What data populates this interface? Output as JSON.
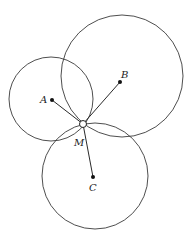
{
  "diagram": {
    "type": "geometry",
    "points": {
      "A": {
        "label": "A",
        "x": 52,
        "y": 100,
        "label_x": 40,
        "label_y": 103
      },
      "B": {
        "label": "B",
        "x": 120,
        "y": 82,
        "label_x": 121,
        "label_y": 78
      },
      "C": {
        "label": "C",
        "x": 93,
        "y": 177,
        "label_x": 89,
        "label_y": 191
      },
      "M": {
        "label": "M",
        "x": 83,
        "y": 124,
        "label_x": 74,
        "label_y": 146
      }
    },
    "circles": [
      {
        "center": "A",
        "cx": 51,
        "cy": 99,
        "r": 42
      },
      {
        "center": "B",
        "cx": 122,
        "cy": 76,
        "r": 61
      },
      {
        "center": "C",
        "cx": 95,
        "cy": 176,
        "r": 53
      }
    ],
    "segments": [
      {
        "from": "M",
        "to": "A"
      },
      {
        "from": "M",
        "to": "B"
      },
      {
        "from": "M",
        "to": "C"
      }
    ]
  }
}
